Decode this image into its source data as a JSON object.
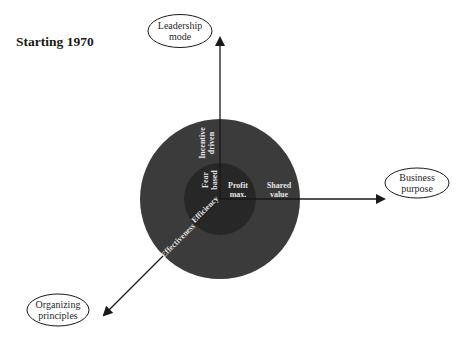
{
  "title": "Starting 1970",
  "axes": {
    "vertical": {
      "label_line1": "Leadership",
      "label_line2": "mode"
    },
    "horizontal": {
      "label_line1": "Business",
      "label_line2": "purpose"
    },
    "diagonal": {
      "label_line1": "Organizing",
      "label_line2": "principles"
    }
  },
  "inner_circle": {
    "leadership": {
      "line1": "Fear",
      "line2": "based"
    },
    "purpose": {
      "line1": "Profit",
      "line2": "max."
    },
    "organizing": "Efficiency"
  },
  "outer_ring": {
    "leadership": {
      "line1": "Incentive",
      "line2": "driven"
    },
    "purpose": {
      "line1": "Shared",
      "line2": "value"
    },
    "organizing": "Effectiveness"
  },
  "colors": {
    "outer_circle": "#3b3b3b",
    "inner_circle": "#272727",
    "lines": "#1a1a1a",
    "inner_text": "#e4e4e4"
  }
}
